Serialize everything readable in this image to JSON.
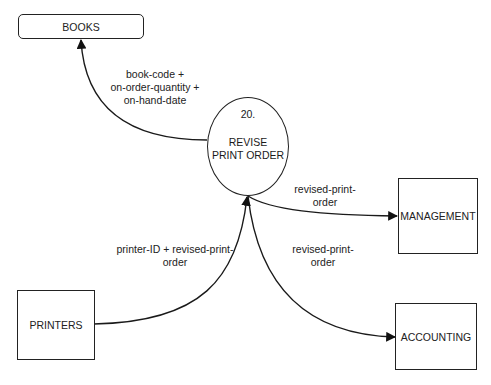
{
  "diagram": {
    "type": "data-flow-diagram",
    "process": {
      "number": "20.",
      "name_line1": "REVISE",
      "name_line2": "PRINT ORDER"
    },
    "data_store": {
      "label": "BOOKS"
    },
    "external_entities": {
      "management": {
        "label": "MANAGEMENT"
      },
      "accounting": {
        "label": "ACCOUNTING"
      },
      "printers": {
        "label": "PRINTERS"
      }
    },
    "flows": {
      "to_books": {
        "line1": "book-code +",
        "line2": "on-order-quantity +",
        "line3": "on-hand-date"
      },
      "to_management": {
        "line1": "revised-print-",
        "line2": "order"
      },
      "to_accounting": {
        "line1": "revised-print-",
        "line2": "order"
      },
      "from_printers": {
        "line1": "printer-ID + revised-print-",
        "line2": "order"
      }
    }
  }
}
